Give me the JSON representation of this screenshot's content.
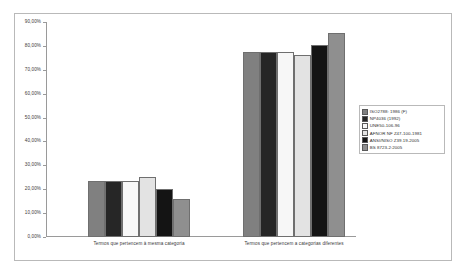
{
  "chart_data": {
    "type": "bar",
    "title": "",
    "xlabel": "",
    "ylabel": "",
    "ylim": [
      0,
      90
    ],
    "grid": false,
    "legend_position": "right",
    "categories": [
      "Termos que pertencem à mesma categoria",
      "Termos que pertencem a categorias diferentes"
    ],
    "y_ticks": [
      "0,00%",
      "10,00%",
      "20,00%",
      "30,00%",
      "40,00%",
      "50,00%",
      "60,00%",
      "70,00%",
      "80,00%",
      "90,00%"
    ],
    "y_tick_values": [
      0,
      10,
      20,
      30,
      40,
      50,
      60,
      70,
      80,
      90
    ],
    "series": [
      {
        "name": "ISO2788: 1986 (F)",
        "color": "#808080",
        "values": [
          23.3,
          77.3
        ]
      },
      {
        "name": "NP4036 (1992)",
        "color": "#262626",
        "values": [
          23.3,
          77.3
        ]
      },
      {
        "name": "UNE50-106-96",
        "color": "#f7f7f7",
        "values": [
          23.3,
          77.5
        ]
      },
      {
        "name": "AFNOR NF Z47-100-1981",
        "color": "#e3e3e3",
        "values": [
          25.3,
          76.2
        ]
      },
      {
        "name": "ANSI/NISO Z39.19-2005",
        "color": "#141414",
        "values": [
          20.3,
          80.5
        ]
      },
      {
        "name": "BS 8723-2:2005",
        "color": "#8f8f8f",
        "values": [
          15.8,
          85.2
        ]
      }
    ]
  }
}
